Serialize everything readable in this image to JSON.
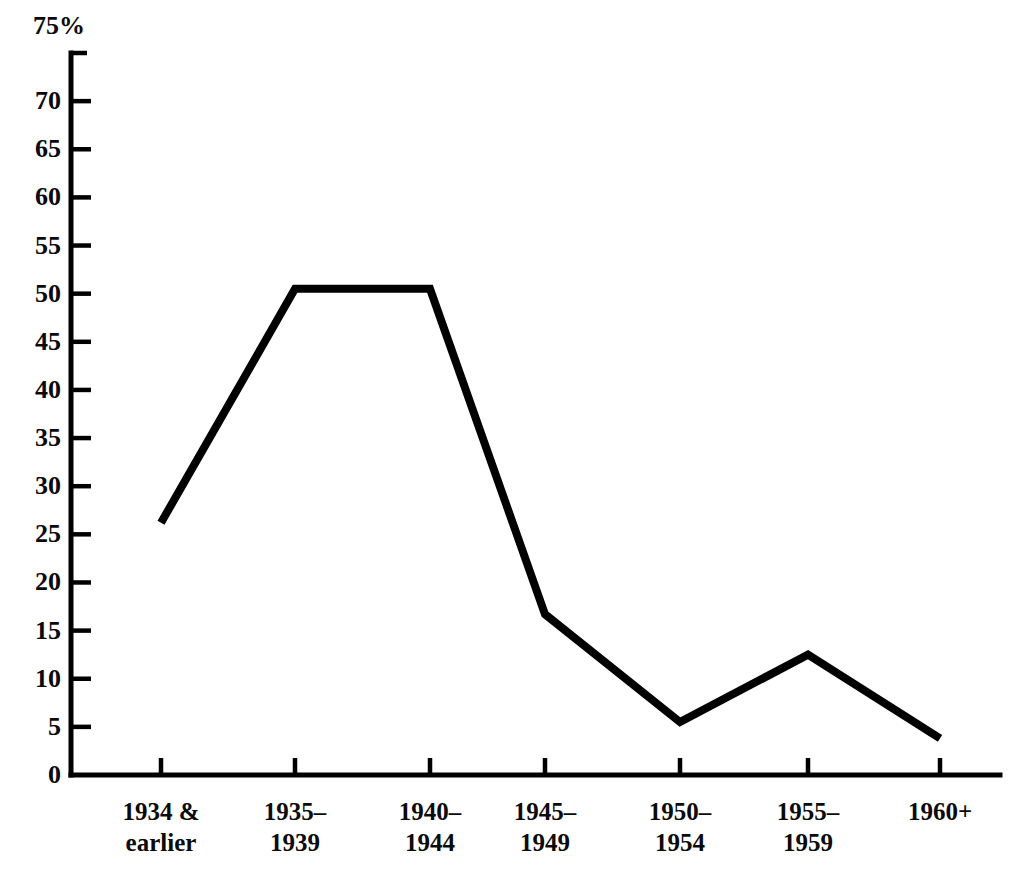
{
  "chart_data": {
    "type": "line",
    "title": "",
    "subtitle": "",
    "xlabel": "",
    "ylabel": "",
    "y_unit_label": "75%",
    "categories": [
      "1934 &\nearlier",
      "1935–\n1939",
      "1940–\n1944",
      "1945–\n1949",
      "1950–\n1954",
      "1955–\n1959",
      "1960+"
    ],
    "category_lines": [
      [
        "1934 &",
        "earlier"
      ],
      [
        "1935–",
        "1939"
      ],
      [
        "1940–",
        "1944"
      ],
      [
        "1945–",
        "1949"
      ],
      [
        "1950–",
        "1954"
      ],
      [
        "1955–",
        "1959"
      ],
      [
        "1960+",
        ""
      ]
    ],
    "values": [
      26.2,
      50.5,
      50.5,
      16.7,
      5.5,
      12.5,
      3.8
    ],
    "ylim": [
      0,
      75
    ],
    "ytick_values": [
      0,
      5,
      10,
      15,
      20,
      25,
      30,
      35,
      40,
      45,
      50,
      55,
      60,
      65,
      70,
      75
    ],
    "ytick_labels": [
      "0",
      "5",
      "10",
      "15",
      "20",
      "25",
      "30",
      "35",
      "40",
      "45",
      "50",
      "55",
      "60",
      "65",
      "70",
      "75%"
    ],
    "grid": false,
    "legend": false,
    "legend_position": "none",
    "line_color": "#000000",
    "line_width_px": 8,
    "axis_color": "#000000",
    "background_color": "#ffffff"
  }
}
